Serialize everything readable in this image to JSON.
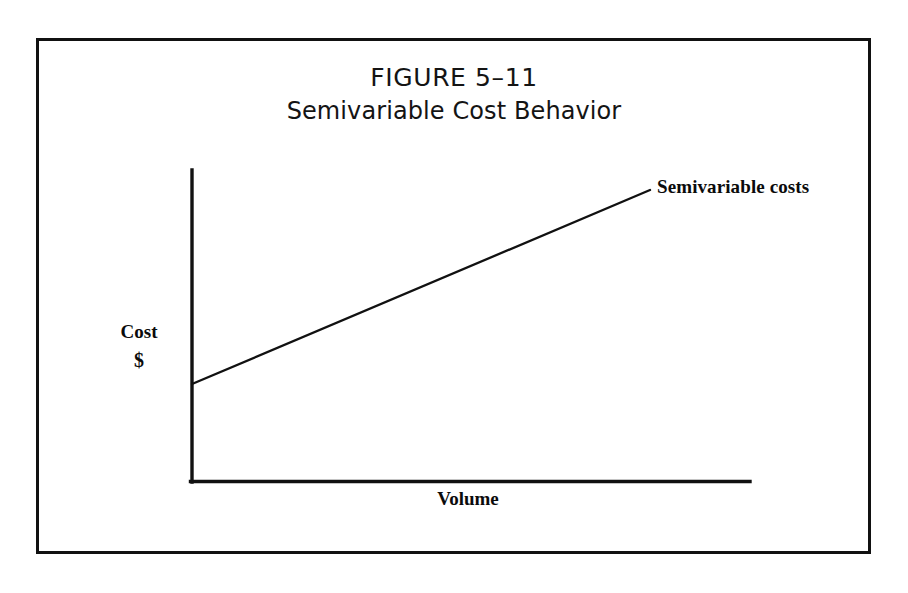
{
  "figure": {
    "number": "FIGURE 5–11",
    "subtitle": "Semivariable Cost Behavior",
    "frame_color": "#111111",
    "ink_color": "#0b0b0b",
    "background_color": "#ffffff"
  },
  "chart_data": {
    "type": "line",
    "title": "FIGURE 5–11",
    "subtitle": "Semivariable Cost Behavior",
    "xlabel": "Volume",
    "ylabel": "Cost\n$",
    "ylabel_line1": "Cost",
    "ylabel_line2": "$",
    "grid": false,
    "legend_position": "end-of-line",
    "axis_ticks": [],
    "xlim": [
      0,
      1
    ],
    "ylim": [
      0,
      1
    ],
    "series": [
      {
        "name": "Semivariable costs",
        "label": "Semivariable costs",
        "color": "#111111",
        "x": [
          0,
          1
        ],
        "y": [
          0.315,
          0.935
        ],
        "intercept": 0.315,
        "slope": 0.62,
        "annotation": "Semivariable costs"
      }
    ],
    "annotations": [
      {
        "text": "Semivariable costs",
        "anchor": "line-end"
      },
      {
        "text": "Cost",
        "anchor": "y-axis"
      },
      {
        "text": "$",
        "anchor": "y-axis"
      },
      {
        "text": "Volume",
        "anchor": "x-axis"
      }
    ]
  },
  "axes": {
    "y_axis": {
      "name": "cost-axis",
      "x": 192,
      "y_top": 170,
      "y_bottom": 482
    },
    "x_axis": {
      "name": "volume-axis",
      "y": 482,
      "x_left": 192,
      "x_right": 750
    }
  },
  "cost_line": {
    "x1": 192,
    "y1": 384,
    "x2": 650,
    "y2": 190
  }
}
